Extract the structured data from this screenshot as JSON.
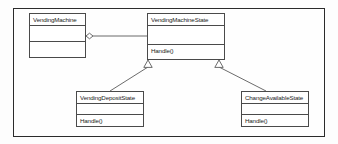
{
  "diagram": {
    "kind": "uml-class-diagram",
    "frame": {
      "border_color": "#2b2b2b"
    },
    "line_color": "#5a5a5a",
    "classes": [
      {
        "id": "vending-machine",
        "name": "VendingMachine",
        "attributes": [],
        "operations": []
      },
      {
        "id": "vending-machine-state",
        "name": "VendingMachineState",
        "attributes": [],
        "operations": [
          "Handle()"
        ]
      },
      {
        "id": "vending-deposit-state",
        "name": "VendingDepositState",
        "attributes": [],
        "operations": [
          "Handle()"
        ]
      },
      {
        "id": "change-available-state",
        "name": "ChangeAvailableState",
        "attributes": [],
        "operations": [
          "Handle()"
        ]
      }
    ],
    "relationships": [
      {
        "id": "aggregation-machine-state",
        "type": "aggregation",
        "source": "VendingMachine",
        "target": "VendingMachineState",
        "marker": "hollow-diamond"
      },
      {
        "id": "generalization-deposit",
        "type": "generalization",
        "source": "VendingDepositState",
        "target": "VendingMachineState",
        "marker": "hollow-triangle"
      },
      {
        "id": "generalization-change",
        "type": "generalization",
        "source": "ChangeAvailableState",
        "target": "VendingMachineState",
        "marker": "hollow-triangle"
      }
    ]
  }
}
